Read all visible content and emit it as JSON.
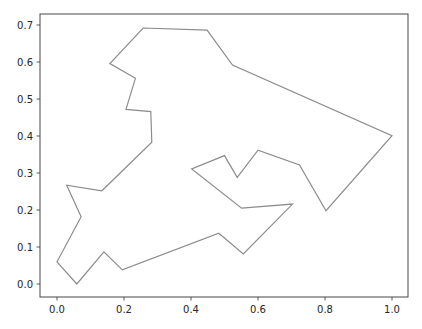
{
  "chart_data": {
    "type": "line",
    "title": "",
    "xlabel": "",
    "ylabel": "",
    "xlim": [
      -0.05,
      1.05
    ],
    "ylim": [
      -0.035,
      0.727
    ],
    "grid": false,
    "legend": null,
    "x_ticks": [
      "0.0",
      "0.2",
      "0.4",
      "0.6",
      "0.8",
      "1.0"
    ],
    "y_ticks": [
      "0.0",
      "0.1",
      "0.2",
      "0.3",
      "0.4",
      "0.5",
      "0.6",
      "0.7"
    ],
    "line_color": "#8c8c8c",
    "series": [
      {
        "name": "polygon outline",
        "closed": true,
        "x": [
          0.0,
          0.059,
          0.14,
          0.195,
          0.483,
          0.556,
          0.703,
          0.551,
          0.402,
          0.5,
          0.538,
          0.6,
          0.724,
          0.803,
          1.0,
          0.524,
          0.448,
          0.257,
          0.158,
          0.234,
          0.206,
          0.28,
          0.283,
          0.134,
          0.029,
          0.072,
          0.0
        ],
        "y": [
          0.06,
          0.0,
          0.087,
          0.038,
          0.137,
          0.081,
          0.216,
          0.205,
          0.311,
          0.347,
          0.288,
          0.362,
          0.322,
          0.198,
          0.401,
          0.592,
          0.686,
          0.692,
          0.596,
          0.556,
          0.472,
          0.466,
          0.383,
          0.252,
          0.267,
          0.182,
          0.06
        ]
      }
    ]
  }
}
